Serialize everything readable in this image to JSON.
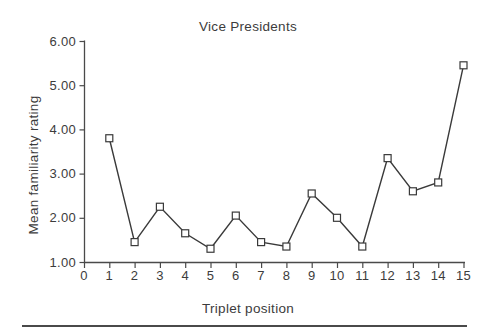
{
  "chart_data": {
    "type": "line",
    "title": "Vice Presidents",
    "xlabel": "Triplet position",
    "ylabel": "Mean familiarity rating",
    "x": [
      1,
      2,
      3,
      4,
      5,
      6,
      7,
      8,
      9,
      10,
      11,
      12,
      13,
      14,
      15
    ],
    "values": [
      3.8,
      1.45,
      2.25,
      1.65,
      1.3,
      2.05,
      1.45,
      1.35,
      2.55,
      2.0,
      1.35,
      3.35,
      2.6,
      2.8,
      5.45
    ],
    "xlim": [
      0,
      15
    ],
    "ylim": [
      1,
      6
    ],
    "xtick_labels": [
      "0",
      "1",
      "2",
      "3",
      "4",
      "5",
      "6",
      "7",
      "8",
      "9",
      "10",
      "11",
      "12",
      "13",
      "14",
      "15"
    ],
    "ytick_values": [
      1,
      2,
      3,
      4,
      5,
      6
    ],
    "ytick_labels": [
      "1.00",
      "2.00",
      "3.00",
      "4.00",
      "5.00",
      "6.00"
    ],
    "marker": "open-square",
    "grid": false,
    "legend": null,
    "line_color": "#3a3a3a",
    "axis_color": "#4a4a4a",
    "marker_fill": "#ffffff",
    "text_color": "#3c3c3c",
    "rule_color": "#4a4a4a"
  }
}
